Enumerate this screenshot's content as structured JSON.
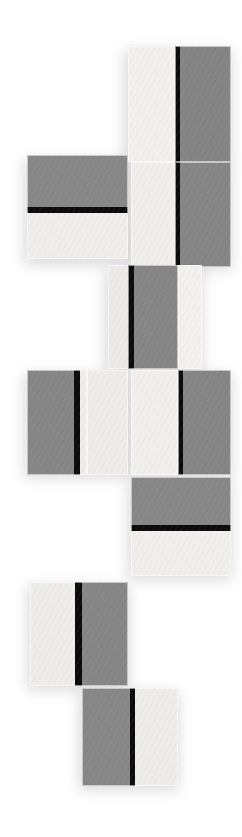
{
  "artwork": {
    "title": "Abstract Geometric Tile Composition",
    "description": "Vertical stack of offset rectangular tiles in light grey and mid grey, each divided by a hard black bar",
    "canvas": {
      "width": 242,
      "height": 837,
      "background": "#ffffff"
    },
    "palette": {
      "light": "#f0efec",
      "light_alt": "#eceae6",
      "dark": "#848484",
      "dark_alt": "#888887",
      "black": "#0b0b0b",
      "background": "#ffffff",
      "shadow": "#8a8a8a"
    },
    "tiles": [
      {
        "id": "tile-1",
        "name": "top-light-panel",
        "x": 128,
        "y": 46,
        "w": 47,
        "h": 116,
        "bands": [
          {
            "type": "light",
            "orient": "v",
            "offset": 0,
            "size": 47,
            "color": "#f1f0ed"
          }
        ]
      },
      {
        "id": "tile-2",
        "name": "top-dark-panel-with-left-bar",
        "x": 175,
        "y": 46,
        "w": 56,
        "h": 116,
        "bands": [
          {
            "type": "black",
            "orient": "v",
            "offset": 0,
            "size": 5,
            "color": "#0b0b0b"
          },
          {
            "type": "dark",
            "orient": "v",
            "offset": 5,
            "size": 51,
            "color": "#848484"
          }
        ]
      },
      {
        "id": "tile-3",
        "name": "second-row-wide-split-panel",
        "x": 27,
        "y": 155,
        "w": 101,
        "h": 104,
        "bands": [
          {
            "type": "dark",
            "orient": "h",
            "offset": 0,
            "size": 52,
            "color": "#878787"
          },
          {
            "type": "black",
            "orient": "h",
            "offset": 52,
            "size": 6,
            "color": "#0b0b0b"
          },
          {
            "type": "light",
            "orient": "h",
            "offset": 58,
            "size": 46,
            "color": "#efeeeb"
          }
        ]
      },
      {
        "id": "tile-4",
        "name": "second-row-light-panel",
        "x": 131,
        "y": 162,
        "w": 44,
        "h": 105,
        "bands": [
          {
            "type": "light",
            "orient": "v",
            "offset": 0,
            "size": 44,
            "color": "#efeeea"
          }
        ]
      },
      {
        "id": "tile-5",
        "name": "second-row-dark-panel-with-left-bar",
        "x": 175,
        "y": 162,
        "w": 56,
        "h": 105,
        "bands": [
          {
            "type": "black",
            "orient": "v",
            "offset": 0,
            "size": 5,
            "color": "#0b0b0b"
          },
          {
            "type": "dark",
            "orient": "v",
            "offset": 5,
            "size": 51,
            "color": "#858585"
          }
        ]
      },
      {
        "id": "tile-6",
        "name": "third-row-light-left-panel",
        "x": 108,
        "y": 265,
        "w": 21,
        "h": 104,
        "bands": [
          {
            "type": "light",
            "orient": "v",
            "offset": 0,
            "size": 21,
            "color": "#ecebe7"
          }
        ]
      },
      {
        "id": "tile-7",
        "name": "third-row-dark-panel-with-left-bar",
        "x": 128,
        "y": 265,
        "w": 50,
        "h": 104,
        "bands": [
          {
            "type": "black",
            "orient": "v",
            "offset": 0,
            "size": 6,
            "color": "#0b0b0b"
          },
          {
            "type": "dark",
            "orient": "v",
            "offset": 6,
            "size": 44,
            "color": "#868686"
          }
        ]
      },
      {
        "id": "tile-8",
        "name": "third-row-light-right-panel",
        "x": 178,
        "y": 265,
        "w": 24,
        "h": 104,
        "bands": [
          {
            "type": "light",
            "orient": "v",
            "offset": 0,
            "size": 24,
            "color": "#f2f1ee"
          }
        ]
      },
      {
        "id": "tile-9",
        "name": "fourth-row-dark-panel-with-right-bar",
        "x": 27,
        "y": 370,
        "w": 60,
        "h": 105,
        "bands": [
          {
            "type": "dark",
            "orient": "v",
            "offset": 0,
            "size": 47,
            "color": "#868686"
          },
          {
            "type": "black",
            "orient": "v",
            "offset": 47,
            "size": 6,
            "color": "#0b0b0b"
          },
          {
            "type": "light",
            "orient": "v",
            "offset": 53,
            "size": 7,
            "color": "#eeedea"
          }
        ]
      },
      {
        "id": "tile-10",
        "name": "fourth-row-light-panel-a",
        "x": 87,
        "y": 370,
        "w": 41,
        "h": 105,
        "bands": [
          {
            "type": "light",
            "orient": "v",
            "offset": 0,
            "size": 41,
            "color": "#eeedea"
          }
        ]
      },
      {
        "id": "tile-11",
        "name": "fourth-row-light-panel-b",
        "x": 131,
        "y": 370,
        "w": 47,
        "h": 105,
        "bands": [
          {
            "type": "light",
            "orient": "v",
            "offset": 0,
            "size": 47,
            "color": "#f0efec"
          }
        ]
      },
      {
        "id": "tile-12",
        "name": "fourth-row-dark-panel-with-left-bar",
        "x": 178,
        "y": 370,
        "w": 53,
        "h": 105,
        "bands": [
          {
            "type": "black",
            "orient": "v",
            "offset": 0,
            "size": 5,
            "color": "#0b0b0b"
          },
          {
            "type": "dark",
            "orient": "v",
            "offset": 5,
            "size": 48,
            "color": "#858585"
          }
        ]
      },
      {
        "id": "tile-13",
        "name": "fifth-row-wide-split-panel",
        "x": 131,
        "y": 477,
        "w": 100,
        "h": 99,
        "bands": [
          {
            "type": "dark",
            "orient": "h",
            "offset": 0,
            "size": 48,
            "color": "#878787"
          },
          {
            "type": "black",
            "orient": "h",
            "offset": 48,
            "size": 6,
            "color": "#0b0b0b"
          },
          {
            "type": "light",
            "orient": "h",
            "offset": 54,
            "size": 45,
            "color": "#f0efec"
          }
        ]
      },
      {
        "id": "tile-14",
        "name": "sixth-row-panel-light-then-dark",
        "x": 30,
        "y": 582,
        "w": 98,
        "h": 104,
        "bands": [
          {
            "type": "light",
            "orient": "v",
            "offset": 0,
            "size": 45,
            "color": "#eeedea"
          },
          {
            "type": "black",
            "orient": "v",
            "offset": 45,
            "size": 7,
            "color": "#0b0b0b"
          },
          {
            "type": "dark",
            "orient": "v",
            "offset": 52,
            "size": 46,
            "color": "#868686"
          }
        ]
      },
      {
        "id": "tile-15",
        "name": "seventh-row-panel-dark-then-light",
        "x": 82,
        "y": 688,
        "w": 96,
        "h": 98,
        "bands": [
          {
            "type": "dark",
            "orient": "v",
            "offset": 0,
            "size": 48,
            "color": "#878787"
          },
          {
            "type": "black",
            "orient": "v",
            "offset": 48,
            "size": 5,
            "color": "#0b0b0b"
          },
          {
            "type": "light",
            "orient": "v",
            "offset": 53,
            "size": 43,
            "color": "#eeedea"
          }
        ]
      }
    ],
    "shadows": [
      {
        "id": "shadow-1",
        "x": 124,
        "y": 50,
        "w": 108,
        "h": 116
      },
      {
        "id": "shadow-2",
        "x": 24,
        "y": 159,
        "w": 106,
        "h": 106
      },
      {
        "id": "shadow-3",
        "x": 128,
        "y": 166,
        "w": 104,
        "h": 104
      },
      {
        "id": "shadow-4",
        "x": 105,
        "y": 269,
        "w": 98,
        "h": 104
      },
      {
        "id": "shadow-5",
        "x": 24,
        "y": 374,
        "w": 208,
        "h": 104
      },
      {
        "id": "shadow-6",
        "x": 128,
        "y": 481,
        "w": 104,
        "h": 99
      },
      {
        "id": "shadow-7",
        "x": 27,
        "y": 586,
        "w": 102,
        "h": 104
      },
      {
        "id": "shadow-8",
        "x": 79,
        "y": 692,
        "w": 100,
        "h": 98
      }
    ]
  }
}
